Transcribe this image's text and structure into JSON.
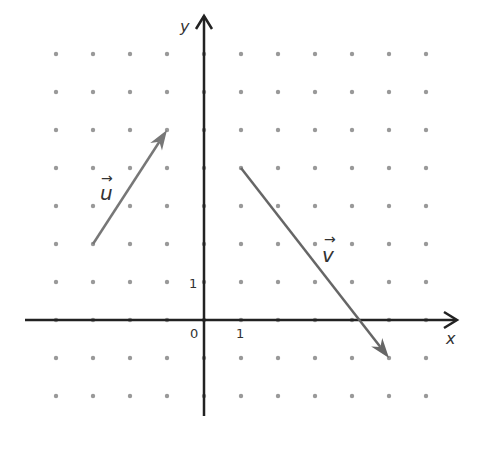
{
  "diagram": {
    "type": "vector-grid",
    "axes": {
      "x_label": "x",
      "y_label": "y",
      "origin_label": "0",
      "x_unit_label": "1",
      "y_unit_label": "1",
      "x_range": [
        -4.8,
        6.8
      ],
      "y_range": [
        -2.6,
        8
      ]
    },
    "grid": {
      "x_values": [
        -4,
        -3,
        -2,
        -1,
        0,
        1,
        2,
        3,
        4,
        5,
        6
      ],
      "y_values": [
        -2,
        -1,
        0,
        1,
        2,
        3,
        4,
        5,
        6,
        7
      ],
      "dot_color": "#999999"
    },
    "vectors": [
      {
        "name": "u",
        "label": "u",
        "arrow_symbol": "→",
        "tail": [
          -3,
          2
        ],
        "head": [
          -1,
          5
        ],
        "components": [
          2,
          3
        ],
        "color": "#777777"
      },
      {
        "name": "v",
        "label": "v",
        "arrow_symbol": "→",
        "tail": [
          1,
          4
        ],
        "head": [
          5,
          -1
        ],
        "components": [
          4,
          -5
        ],
        "color": "#666666"
      }
    ],
    "colors": {
      "axis": "#222222",
      "text": "#333333",
      "background": "#ffffff"
    }
  }
}
